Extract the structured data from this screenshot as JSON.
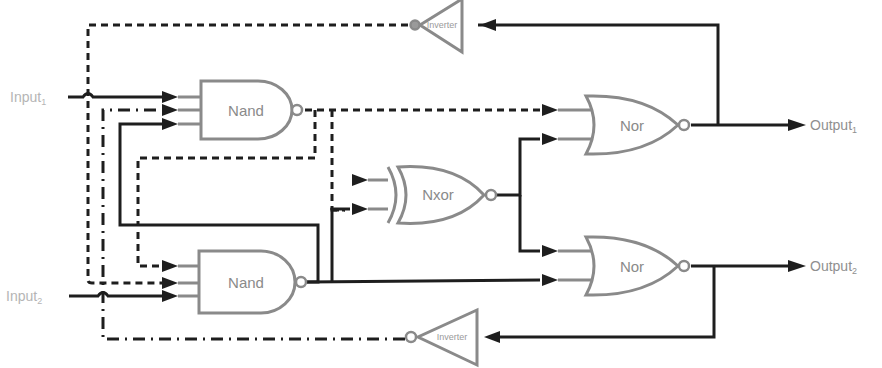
{
  "diagram": {
    "type": "logic-circuit",
    "inputs": [
      {
        "label": "Input",
        "subscript": "1"
      },
      {
        "label": "Input",
        "subscript": "2"
      }
    ],
    "outputs": [
      {
        "label": "Output",
        "subscript": "1"
      },
      {
        "label": "Output",
        "subscript": "2"
      }
    ],
    "gates": [
      {
        "id": "nand1",
        "type": "NAND",
        "label": "Nand"
      },
      {
        "id": "nand2",
        "type": "NAND",
        "label": "Nand"
      },
      {
        "id": "nxor",
        "type": "XNOR",
        "label": "Nxor"
      },
      {
        "id": "nor1",
        "type": "NOR",
        "label": "Nor"
      },
      {
        "id": "nor2",
        "type": "NOR",
        "label": "Nor"
      },
      {
        "id": "inv_top",
        "type": "NOT",
        "label": "Inverter"
      },
      {
        "id": "inv_bottom",
        "type": "NOT",
        "label": "Inverter"
      }
    ],
    "connections": [
      {
        "from": "Input1",
        "to": "nand1.in1",
        "style": "solid"
      },
      {
        "from": "inv_bottom.out",
        "to": "nand1.in2",
        "style": "dash-dot"
      },
      {
        "from": "nand2.out",
        "to": "nand1.in3",
        "style": "solid"
      },
      {
        "from": "nand1.out",
        "to": "nand2.in1",
        "style": "dashed"
      },
      {
        "from": "inv_top.out",
        "to": "nand2.in2",
        "style": "dashed"
      },
      {
        "from": "Input2",
        "to": "nand2.in3",
        "style": "solid"
      },
      {
        "from": "nand1.out",
        "to": "nxor.in1",
        "style": "dashed"
      },
      {
        "from": "nand2.out",
        "to": "nxor.in2",
        "style": "solid"
      },
      {
        "from": "nand1.out",
        "to": "nor1.in1",
        "style": "dashed"
      },
      {
        "from": "nxor.out",
        "to": "nor1.in2",
        "style": "solid"
      },
      {
        "from": "nxor.out",
        "to": "nor2.in1",
        "style": "solid"
      },
      {
        "from": "nand2.out",
        "to": "nor2.in2",
        "style": "solid"
      },
      {
        "from": "nor1.out",
        "to": "Output1",
        "style": "solid"
      },
      {
        "from": "nor2.out",
        "to": "Output2",
        "style": "solid"
      },
      {
        "from": "nor1.out",
        "to": "inv_top.in",
        "style": "solid"
      },
      {
        "from": "nor2.out",
        "to": "inv_bottom.in",
        "style": "solid"
      }
    ],
    "colors": {
      "wire": "#1e1e1e",
      "gate_outline": "#8a8a8a",
      "input_label": "#b5b5b5",
      "output_label": "#8f8f8f",
      "background": "#ffffff"
    }
  }
}
